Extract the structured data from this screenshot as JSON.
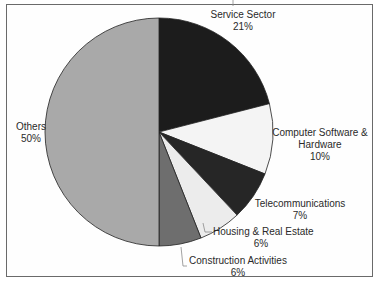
{
  "chart_data": {
    "type": "pie",
    "title": "",
    "start_angle_deg": 0,
    "direction": "clockwise",
    "slices": [
      {
        "label": "Service Sector",
        "value": 21,
        "display": "21%",
        "color": "#1c1c1c"
      },
      {
        "label": "Computer Software & Hardware",
        "label_lines": [
          "Computer Software &",
          "Hardware"
        ],
        "value": 10,
        "display": "10%",
        "color": "#f4f4f4"
      },
      {
        "label": "Telecommunications",
        "value": 7,
        "display": "7%",
        "color": "#262626"
      },
      {
        "label": "Housing & Real Estate",
        "value": 6,
        "display": "6%",
        "color": "#ececec"
      },
      {
        "label": "Construction Activities",
        "value": 6,
        "display": "6%",
        "color": "#6e6e6e"
      },
      {
        "label": "Others",
        "value": 50,
        "display": "50%",
        "color": "#a9a9a9"
      }
    ],
    "legend": "none (direct labels)"
  },
  "labels": {
    "service": {
      "name": "Service Sector",
      "pct": "21%"
    },
    "software": {
      "name1": "Computer Software &",
      "name2": "Hardware",
      "pct": "10%"
    },
    "telecom": {
      "name": "Telecommunications",
      "pct": "7%"
    },
    "housing": {
      "name": "Housing & Real Estate",
      "pct": "6%"
    },
    "construction": {
      "name": "Construction Activities",
      "pct": "6%"
    },
    "others": {
      "name": "Others",
      "pct": "50%"
    }
  }
}
